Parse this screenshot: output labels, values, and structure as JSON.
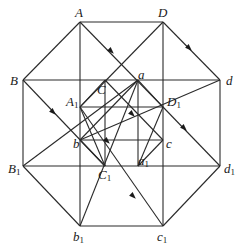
{
  "figure": {
    "vertices": {
      "A": {
        "label": "A",
        "sub": "",
        "x": 80,
        "y": 22
      },
      "D": {
        "label": "D",
        "sub": "",
        "x": 163,
        "y": 22
      },
      "B": {
        "label": "B",
        "sub": "",
        "x": 23,
        "y": 80
      },
      "d": {
        "label": "d",
        "sub": "",
        "x": 220,
        "y": 80
      },
      "C": {
        "label": "C",
        "sub": "",
        "x": 105,
        "y": 80
      },
      "a": {
        "label": "a",
        "sub": "",
        "x": 138,
        "y": 80
      },
      "A1": {
        "label": "A",
        "sub": "1",
        "x": 80,
        "y": 107
      },
      "D1": {
        "label": "D",
        "sub": "1",
        "x": 163,
        "y": 107
      },
      "b": {
        "label": "b",
        "sub": "",
        "x": 80,
        "y": 140
      },
      "c": {
        "label": "c",
        "sub": "",
        "x": 163,
        "y": 140
      },
      "B1": {
        "label": "B",
        "sub": "1",
        "x": 23,
        "y": 166
      },
      "d1": {
        "label": "d",
        "sub": "1",
        "x": 220,
        "y": 166
      },
      "C1": {
        "label": "C",
        "sub": "1",
        "x": 105,
        "y": 166
      },
      "a1": {
        "label": "a",
        "sub": "1",
        "x": 138,
        "y": 166
      },
      "b1": {
        "label": "b",
        "sub": "1",
        "x": 80,
        "y": 226
      },
      "c1": {
        "label": "c",
        "sub": "1",
        "x": 163,
        "y": 226
      }
    },
    "labels": [
      {
        "id": "A",
        "text": "A",
        "sub": "",
        "left": 75,
        "top": 6
      },
      {
        "id": "D",
        "text": "D",
        "sub": "",
        "left": 158,
        "top": 6
      },
      {
        "id": "B",
        "text": "B",
        "sub": "",
        "left": 10,
        "top": 74
      },
      {
        "id": "d",
        "text": "d",
        "sub": "",
        "left": 226,
        "top": 74
      },
      {
        "id": "C",
        "text": "C",
        "sub": "",
        "left": 97,
        "top": 83
      },
      {
        "id": "a",
        "text": "a",
        "sub": "",
        "left": 138,
        "top": 68
      },
      {
        "id": "A1",
        "text": "A",
        "sub": "1",
        "left": 66,
        "top": 95
      },
      {
        "id": "D1",
        "text": "D",
        "sub": "1",
        "left": 167,
        "top": 95
      },
      {
        "id": "b",
        "text": "b",
        "sub": "",
        "left": 73,
        "top": 137
      },
      {
        "id": "c",
        "text": "c",
        "sub": "",
        "left": 166,
        "top": 137
      },
      {
        "id": "B1",
        "text": "B",
        "sub": "1",
        "left": 8,
        "top": 162
      },
      {
        "id": "d1",
        "text": "d",
        "sub": "1",
        "left": 224,
        "top": 162
      },
      {
        "id": "C1",
        "text": "C",
        "sub": "1",
        "left": 98,
        "top": 168
      },
      {
        "id": "a1",
        "text": "a",
        "sub": "1",
        "left": 138,
        "top": 154
      },
      {
        "id": "b1",
        "text": "b",
        "sub": "1",
        "left": 73,
        "top": 230
      },
      {
        "id": "c1",
        "text": "c",
        "sub": "1",
        "left": 157,
        "top": 230
      }
    ],
    "edges": [
      [
        "A",
        "D"
      ],
      [
        "D",
        "d"
      ],
      [
        "d",
        "d1"
      ],
      [
        "d1",
        "c1"
      ],
      [
        "c1",
        "b1"
      ],
      [
        "b1",
        "B1"
      ],
      [
        "B1",
        "B"
      ],
      [
        "B",
        "A"
      ],
      [
        "B",
        "d"
      ],
      [
        "B1",
        "d1"
      ],
      [
        "A1",
        "D1"
      ],
      [
        "b",
        "c"
      ],
      [
        "A",
        "b1"
      ],
      [
        "D",
        "c1"
      ],
      [
        "C",
        "C1"
      ],
      [
        "a",
        "a1"
      ],
      [
        "A",
        "D1"
      ],
      [
        "D",
        "A1"
      ],
      [
        "B",
        "C1"
      ],
      [
        "B1",
        "a"
      ],
      [
        "d",
        "b"
      ],
      [
        "d1",
        "D1"
      ],
      [
        "b1",
        "a"
      ],
      [
        "c1",
        "A1"
      ],
      [
        "A1",
        "C1"
      ],
      [
        "D1",
        "a1"
      ],
      [
        "C",
        "c"
      ],
      [
        "a",
        "b"
      ],
      [
        "C",
        "A1"
      ],
      [
        "a",
        "D1"
      ],
      [
        "b",
        "C1"
      ],
      [
        "c",
        "a1"
      ]
    ],
    "arrows": [
      {
        "x": 111,
        "y": 51,
        "angle": 45
      },
      {
        "x": 189,
        "y": 48,
        "angle": 45
      },
      {
        "x": 53,
        "y": 112,
        "angle": 45
      },
      {
        "x": 133,
        "y": 196,
        "angle": 45
      },
      {
        "x": 184,
        "y": 128,
        "angle": 45
      },
      {
        "x": 132,
        "y": 114,
        "angle": 45
      },
      {
        "x": 107,
        "y": 141,
        "angle": 45
      }
    ],
    "colors": {
      "line": "#2a2a2a",
      "text": "#1a1a1a",
      "background": "#ffffff"
    }
  }
}
